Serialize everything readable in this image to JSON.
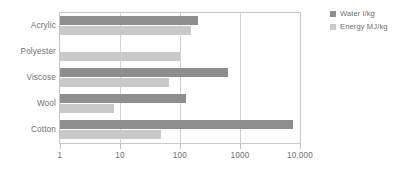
{
  "chart_data": {
    "type": "bar",
    "orientation": "horizontal",
    "title": "",
    "xlabel": "",
    "ylabel": "",
    "xscale": "log",
    "xlim": [
      1,
      10000
    ],
    "grid": true,
    "legend_position": "right",
    "xticks": [
      {
        "value": 1,
        "label": "1"
      },
      {
        "value": 10,
        "label": "10"
      },
      {
        "value": 100,
        "label": "100"
      },
      {
        "value": 1000,
        "label": "1000"
      },
      {
        "value": 10000,
        "label": "10,000"
      }
    ],
    "categories": [
      "Acrylic",
      "Polyester",
      "Viscose",
      "Wool",
      "Cotton"
    ],
    "series": [
      {
        "name": "Water l/kg",
        "color": "#8e8e8e",
        "values": [
          200,
          null,
          640,
          125,
          7500
        ]
      },
      {
        "name": "Energy MJ/kg",
        "color": "#c9c9c9",
        "values": [
          150,
          100,
          65,
          8,
          49
        ]
      }
    ]
  },
  "legend": {
    "entries": [
      {
        "label": "Water l/kg",
        "color": "#8e8e8e"
      },
      {
        "label": "Energy MJ/kg",
        "color": "#c9c9c9"
      }
    ]
  },
  "colors": {
    "water": "#8e8e8e",
    "energy": "#c9c9c9",
    "gridline": "#d2d2d2",
    "axis": "#c9c9c9",
    "text": "#6f6f6f",
    "background": "#ffffff"
  }
}
